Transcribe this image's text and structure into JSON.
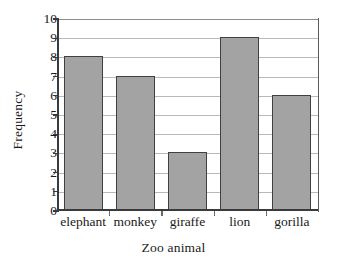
{
  "chart_data": {
    "type": "bar",
    "title": "",
    "categories": [
      "elephant",
      "monkey",
      "giraffe",
      "lion",
      "gorilla"
    ],
    "values": [
      8,
      7,
      3,
      9,
      6
    ],
    "series": [
      {
        "name": "Frequency",
        "values": [
          8,
          7,
          3,
          9,
          6
        ]
      }
    ],
    "xlabel": "Zoo animal",
    "ylabel": "Frequency",
    "ylim": [
      0,
      10
    ],
    "ytick_labels": [
      "0",
      "1",
      "2",
      "3",
      "4",
      "5",
      "6",
      "7",
      "8",
      "9",
      "10"
    ],
    "ytick_values": [
      0,
      1,
      2,
      3,
      4,
      5,
      6,
      7,
      8,
      9,
      10
    ],
    "ytick_step": 1,
    "grid": "horizontal",
    "legend": "none",
    "bar_color": "#a3a3a3",
    "bar_edge_color": "#404040",
    "gridline_color": "#b9b9b9",
    "axis_color": "#3a3a3a",
    "text_color": "#1a1a1a",
    "background": "#ffffff"
  }
}
